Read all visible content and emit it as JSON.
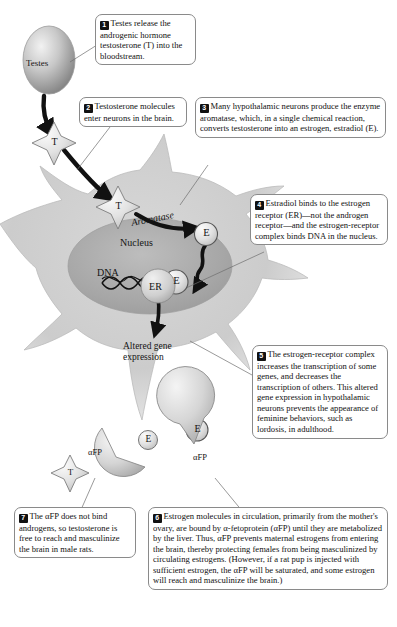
{
  "figure": {
    "steps": [
      {
        "number": "1",
        "text": "Testes release the androgenic hormone testosterone (T) into the bloodstream."
      },
      {
        "number": "2",
        "text": "Testosterone molecules enter neurons in the brain."
      },
      {
        "number": "3",
        "text": "Many hypothalamic neurons produce the enzyme aromatase, which, in a single chemical reaction, converts testosterone into an estrogen, estradiol (E)."
      },
      {
        "number": "4",
        "text": "Estradiol binds to the estrogen receptor (ER)—not the androgen receptor—and the estrogen-receptor complex binds DNA in the nucleus."
      },
      {
        "number": "5",
        "text": "The estrogen-receptor complex increases the transcription of some genes, and decreases the transcription of others. This altered gene expression in hypothalamic neurons prevents the appearance of feminine behaviors, such as lordosis, in adulthood."
      },
      {
        "number": "6",
        "text": "Estrogen molecules in circulation, primarily from the mother's ovary, are bound by α-fetoprotein (αFP) until they are metabolized by the liver. Thus, αFP prevents maternal estrogens from entering the brain, thereby protecting females from being masculinized by circulating estrogens. (However, if a rat pup is injected with sufficient estrogen, the αFP will be saturated, and some estrogen will reach and masculinize the brain.)"
      },
      {
        "number": "7",
        "text": "The αFP does not bind androgens, so testosterone is free to reach and masculinize the brain in male rats."
      }
    ],
    "labels": {
      "testes": "Testes",
      "aromatase": "Aromatase",
      "nucleus": "Nucleus",
      "dna": "DNA",
      "altered_gene_expression": "Altered gene\nexpression",
      "afp_unbound": "αFP",
      "afp_bound": "αFP"
    },
    "molecules": {
      "testosterone_symbol": "T",
      "estradiol_symbol": "E",
      "estrogen_receptor_symbol": "ER"
    },
    "colors": {
      "cell_fill": "#c9c9c9",
      "nucleus_fill": "#a8a8a8",
      "molecule_fill": "#dcdcdc",
      "outline": "#8a8a8a",
      "ink": "#111111",
      "badge_bg": "#111111",
      "badge_fg": "#ffffff"
    }
  }
}
